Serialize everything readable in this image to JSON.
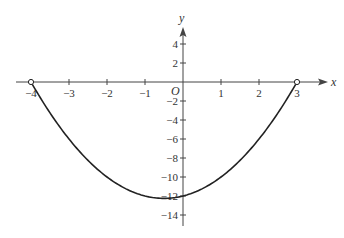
{
  "chart_data": {
    "type": "line",
    "title": "",
    "xlabel": "x",
    "ylabel": "y",
    "origin_label": "O",
    "xlim": [
      -4.4,
      3.8
    ],
    "ylim": [
      -15,
      5.8
    ],
    "x_ticks": [
      -4,
      -3,
      -2,
      -1,
      1,
      2,
      3
    ],
    "x_tick_labels": [
      "−4",
      "−3",
      "−2",
      "−1",
      "1",
      "2",
      "3"
    ],
    "y_ticks": [
      4,
      2,
      -2,
      -4,
      -6,
      -8,
      -10,
      -12,
      -14
    ],
    "y_tick_labels": [
      "4",
      "2",
      "−2",
      "−4",
      "−6",
      "−8",
      "−10",
      "−12",
      "−14"
    ],
    "grid": false,
    "series": [
      {
        "name": "y = x^2 + x - 12",
        "domain": [
          -4,
          3
        ],
        "endpoints": "open",
        "x": [
          -4,
          -3.5,
          -3,
          -2.5,
          -2,
          -1.5,
          -1,
          -0.5,
          0,
          0.5,
          1,
          1.5,
          2,
          2.5,
          3
        ],
        "y": [
          0,
          -3.75,
          -6,
          -7.75,
          -10,
          -11.25,
          -12,
          -12.25,
          -12,
          -11.25,
          -10,
          -8.25,
          -6,
          -3.25,
          0
        ]
      }
    ],
    "open_points": [
      [
        -4,
        0
      ],
      [
        3,
        0
      ]
    ],
    "colors": {
      "curve": "#222222",
      "axes": "#444444",
      "text": "#333333"
    }
  }
}
